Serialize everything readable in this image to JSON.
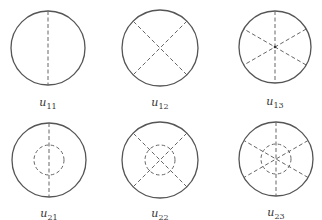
{
  "figure": {
    "modes": [
      {
        "id": "u11",
        "label_base": "u",
        "label_sub": "11",
        "cx": 48,
        "cy": 48,
        "r": 37,
        "diameters": 1,
        "inner_circle": false,
        "label_x": 48,
        "label_y": 96
      },
      {
        "id": "u12",
        "label_base": "u",
        "label_sub": "12",
        "cx": 160,
        "cy": 48,
        "r": 38,
        "diameters": 2,
        "inner_circle": false,
        "label_x": 160,
        "label_y": 96
      },
      {
        "id": "u13",
        "label_base": "u",
        "label_sub": "13",
        "cx": 275,
        "cy": 47,
        "r": 36,
        "diameters": 3,
        "inner_circle": false,
        "label_x": 275,
        "label_y": 95
      },
      {
        "id": "u21",
        "label_base": "u",
        "label_sub": "21",
        "cx": 49,
        "cy": 160,
        "r": 37,
        "diameters": 1,
        "inner_circle": true,
        "inner_r": 15,
        "label_x": 49,
        "label_y": 207
      },
      {
        "id": "u22",
        "label_base": "u",
        "label_sub": "22",
        "cx": 160,
        "cy": 160,
        "r": 38,
        "diameters": 2,
        "inner_circle": true,
        "inner_r": 15,
        "label_x": 160,
        "label_y": 207
      },
      {
        "id": "u23",
        "label_base": "u",
        "label_sub": "23",
        "cx": 276,
        "cy": 159,
        "r": 37,
        "diameters": 3,
        "inner_circle": true,
        "inner_r": 15,
        "label_x": 276,
        "label_y": 206
      }
    ],
    "colors": {
      "outline": "#555555",
      "dashed": "#666666",
      "label": "#333333"
    }
  }
}
